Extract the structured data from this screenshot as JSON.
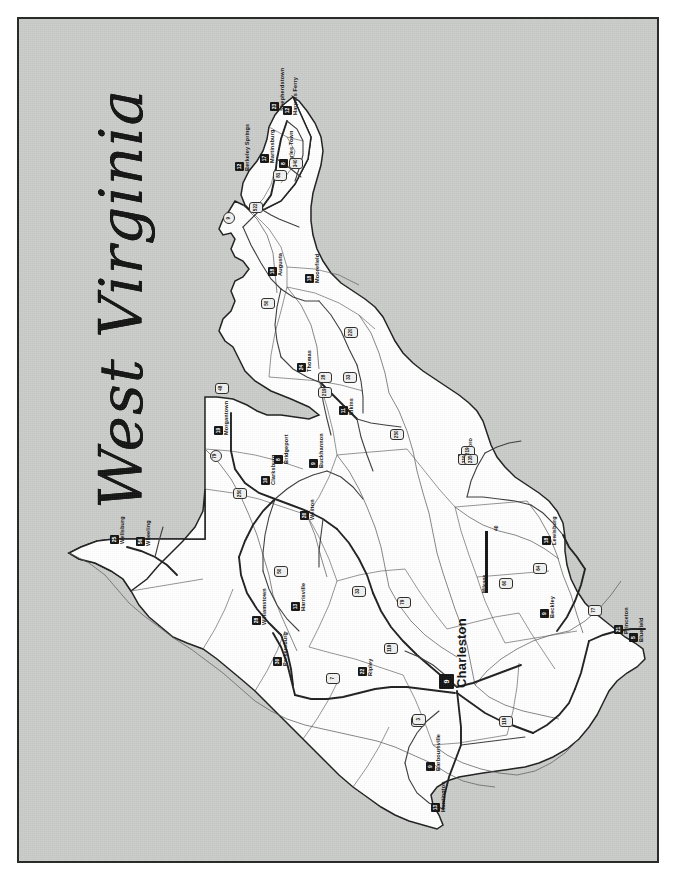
{
  "document": {
    "title": "West Virginia",
    "title_words": [
      "West",
      "Virginia"
    ],
    "orientation": "rotated-90-ccw",
    "frame_color": "#2b2b2b",
    "background_color": "#c9cbc9",
    "land_color": "#ffffff",
    "surround_color": "#c9cbc9"
  },
  "scale": {
    "label": "Mileage",
    "value": "40",
    "bar_orientation": "vertical"
  },
  "cities": [
    {
      "name": "Shepherdstown",
      "marker": "23",
      "x": 268,
      "y": 100
    },
    {
      "name": "Harpers Ferry",
      "marker": "12",
      "x": 281,
      "y": 104
    },
    {
      "name": "Martinsburg",
      "marker": "17",
      "x": 258,
      "y": 152
    },
    {
      "name": "Charles Town",
      "marker": "8",
      "x": 277,
      "y": 157
    },
    {
      "name": "Berkeley Springs",
      "marker": "12",
      "x": 233,
      "y": 160
    },
    {
      "name": "Augusta",
      "marker": "18",
      "x": 266,
      "y": 265
    },
    {
      "name": "Moorefield",
      "marker": "18",
      "x": 303,
      "y": 272
    },
    {
      "name": "Thomas",
      "marker": "24",
      "x": 295,
      "y": 361
    },
    {
      "name": "Elkins",
      "marker": "11",
      "x": 337,
      "y": 404
    },
    {
      "name": "Morgantown",
      "marker": "19",
      "x": 212,
      "y": 424
    },
    {
      "name": "Clarksburg",
      "marker": "10",
      "x": 259,
      "y": 474
    },
    {
      "name": "Bridgeport",
      "marker": "8",
      "x": 272,
      "y": 453
    },
    {
      "name": "Buckhannon",
      "marker": "9",
      "x": 307,
      "y": 457
    },
    {
      "name": "Weston",
      "marker": "20",
      "x": 298,
      "y": 509
    },
    {
      "name": "Hillsboro",
      "marker": "17",
      "x": 456,
      "y": 452
    },
    {
      "name": "Wellsburg",
      "marker": "25",
      "x": 108,
      "y": 533
    },
    {
      "name": "Wheeling",
      "marker": "56",
      "x": 134,
      "y": 535
    },
    {
      "name": "Williamstown",
      "marker": "28",
      "x": 250,
      "y": 614
    },
    {
      "name": "Parkersburg",
      "marker": "30",
      "x": 271,
      "y": 655
    },
    {
      "name": "Harrisville",
      "marker": "13",
      "x": 289,
      "y": 600
    },
    {
      "name": "Ripley",
      "marker": "22",
      "x": 356,
      "y": 665
    },
    {
      "name": "Lewisburg",
      "marker": "18",
      "x": 540,
      "y": 534
    },
    {
      "name": "Beckley",
      "marker": "9",
      "x": 538,
      "y": 607
    },
    {
      "name": "Princeton",
      "marker": "21",
      "x": 612,
      "y": 623
    },
    {
      "name": "Bluefield",
      "marker": "5",
      "x": 627,
      "y": 631
    },
    {
      "name": "Barboursville",
      "marker": "9",
      "x": 424,
      "y": 760
    },
    {
      "name": "Huntington",
      "marker": "13",
      "x": 429,
      "y": 801
    },
    {
      "name": "Charleston",
      "marker": "9",
      "x": 437,
      "y": 672,
      "size": "big"
    }
  ],
  "routes": [
    {
      "number": "340",
      "x": 287,
      "y": 156,
      "shape": "shield"
    },
    {
      "number": "81",
      "x": 271,
      "y": 168,
      "shape": "shield"
    },
    {
      "number": "522",
      "x": 247,
      "y": 200,
      "shape": "shield"
    },
    {
      "number": "9",
      "x": 221,
      "y": 210,
      "shape": "circle"
    },
    {
      "number": "50",
      "x": 259,
      "y": 296,
      "shape": "shield"
    },
    {
      "number": "220",
      "x": 342,
      "y": 325,
      "shape": "shield"
    },
    {
      "number": "28",
      "x": 316,
      "y": 370,
      "shape": "shield"
    },
    {
      "number": "33",
      "x": 341,
      "y": 370,
      "shape": "shield"
    },
    {
      "number": "219",
      "x": 316,
      "y": 385,
      "shape": "shield"
    },
    {
      "number": "250",
      "x": 388,
      "y": 427,
      "shape": "shield"
    },
    {
      "number": "48",
      "x": 213,
      "y": 381,
      "shape": "shield"
    },
    {
      "number": "79",
      "x": 208,
      "y": 448,
      "shape": "circle"
    },
    {
      "number": "250",
      "x": 231,
      "y": 486,
      "shape": "shield"
    },
    {
      "number": "50",
      "x": 272,
      "y": 564,
      "shape": "shield"
    },
    {
      "number": "33",
      "x": 350,
      "y": 584,
      "shape": "shield"
    },
    {
      "number": "79",
      "x": 395,
      "y": 595,
      "shape": "shield"
    },
    {
      "number": "119",
      "x": 382,
      "y": 641,
      "shape": "shield"
    },
    {
      "number": "7",
      "x": 324,
      "y": 671,
      "shape": "shield"
    },
    {
      "number": "219",
      "x": 459,
      "y": 444,
      "shape": "shield"
    },
    {
      "number": "219",
      "x": 456,
      "y": 452,
      "shape": "shield"
    },
    {
      "number": "235",
      "x": 462,
      "y": 452,
      "shape": "shield"
    },
    {
      "number": "64",
      "x": 531,
      "y": 561,
      "shape": "shield"
    },
    {
      "number": "60",
      "x": 497,
      "y": 576,
      "shape": "shield"
    },
    {
      "number": "77",
      "x": 586,
      "y": 603,
      "shape": "shield"
    },
    {
      "number": "64",
      "x": 409,
      "y": 714,
      "shape": "shield"
    },
    {
      "number": "119",
      "x": 497,
      "y": 714,
      "shape": "shield"
    },
    {
      "number": "3",
      "x": 410,
      "y": 712,
      "shape": "shield"
    }
  ],
  "regions": {
    "eastern_panhandle": "Eastern Panhandle",
    "northern_panhandle": "Northern Panhandle"
  }
}
